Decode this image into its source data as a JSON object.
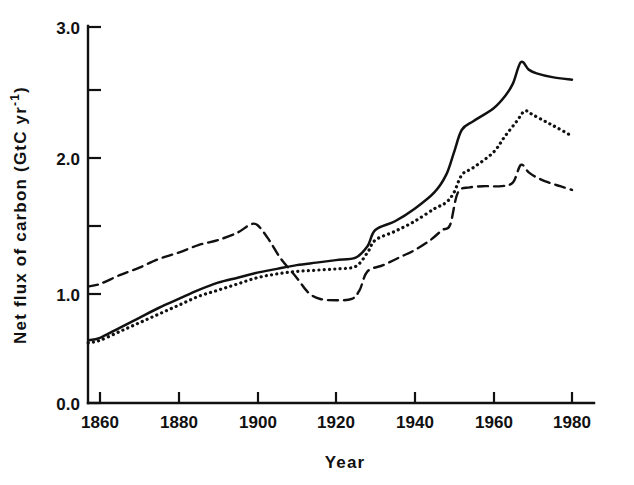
{
  "chart_data": {
    "type": "line",
    "title": "",
    "xlabel": "Year",
    "ylabel": "Net flux of carbon (GtC yr-1)",
    "ylabel_main": "Net flux of carbon (GtC yr",
    "ylabel_sup": "-1",
    "ylabel_tail": ")",
    "xlim": [
      1856,
      1982
    ],
    "ylim": [
      0.0,
      3.0
    ],
    "grid": false,
    "legend": "none",
    "x_ticks": [
      1860,
      1880,
      1900,
      1920,
      1940,
      1960,
      1980
    ],
    "x_tick_labels": [
      "1860",
      "1880",
      "1900",
      "1920",
      "1940",
      "1960",
      "1980"
    ],
    "y_ticks": [
      0.0,
      0.5,
      1.0,
      1.5,
      2.0,
      2.5,
      3.0
    ],
    "y_tick_labels": [
      "0.0",
      "",
      "1.0",
      "",
      "2.0",
      "",
      "3.0"
    ],
    "y_labeled_ticks": [
      0.0,
      1.0,
      2.0,
      3.0
    ],
    "series": [
      {
        "name": "solid",
        "style": "solid",
        "color": "#111111",
        "x": [
          1857,
          1860,
          1865,
          1870,
          1875,
          1880,
          1885,
          1890,
          1895,
          1900,
          1905,
          1910,
          1915,
          1920,
          1925,
          1928,
          1930,
          1935,
          1940,
          1945,
          1948,
          1950,
          1952,
          1955,
          1960,
          1963,
          1965,
          1967,
          1969,
          1971,
          1975,
          1980
        ],
        "y": [
          0.5,
          0.52,
          0.6,
          0.68,
          0.76,
          0.83,
          0.9,
          0.96,
          1.0,
          1.04,
          1.07,
          1.1,
          1.12,
          1.14,
          1.16,
          1.25,
          1.38,
          1.45,
          1.55,
          1.68,
          1.82,
          2.0,
          2.18,
          2.25,
          2.35,
          2.45,
          2.55,
          2.72,
          2.66,
          2.63,
          2.6,
          2.58
        ]
      },
      {
        "name": "dotted",
        "style": "dotted",
        "color": "#111111",
        "x": [
          1857,
          1860,
          1865,
          1870,
          1875,
          1880,
          1885,
          1890,
          1895,
          1900,
          1905,
          1910,
          1915,
          1920,
          1925,
          1928,
          1930,
          1935,
          1940,
          1945,
          1948,
          1950,
          1952,
          1955,
          1960,
          1963,
          1966,
          1968,
          1970,
          1973,
          1976,
          1980
        ],
        "y": [
          0.48,
          0.5,
          0.57,
          0.64,
          0.71,
          0.78,
          0.85,
          0.9,
          0.95,
          1.0,
          1.03,
          1.05,
          1.06,
          1.07,
          1.09,
          1.2,
          1.3,
          1.37,
          1.45,
          1.55,
          1.6,
          1.68,
          1.82,
          1.88,
          2.0,
          2.13,
          2.25,
          2.33,
          2.3,
          2.25,
          2.2,
          2.13
        ]
      },
      {
        "name": "dashed",
        "style": "dashed",
        "color": "#111111",
        "x": [
          1857,
          1860,
          1865,
          1870,
          1875,
          1880,
          1885,
          1890,
          1895,
          1898,
          1900,
          1903,
          1906,
          1910,
          1913,
          1916,
          1920,
          1924,
          1926,
          1928,
          1932,
          1936,
          1940,
          1944,
          1947,
          1949,
          1951,
          1954,
          1958,
          1962,
          1965,
          1967,
          1969,
          1971,
          1974,
          1977,
          1980
        ],
        "y": [
          0.93,
          0.95,
          1.02,
          1.08,
          1.15,
          1.2,
          1.26,
          1.3,
          1.36,
          1.42,
          1.42,
          1.3,
          1.15,
          1.0,
          0.88,
          0.83,
          0.82,
          0.83,
          0.9,
          1.05,
          1.1,
          1.16,
          1.22,
          1.3,
          1.38,
          1.42,
          1.68,
          1.72,
          1.73,
          1.73,
          1.76,
          1.9,
          1.84,
          1.8,
          1.76,
          1.73,
          1.7
        ]
      }
    ],
    "notes": {
      "peak_solid": 2.72,
      "peak_solid_year": 1967,
      "peak_dotted": 2.33,
      "peak_dotted_year": 1968,
      "peak_dashed": 1.9,
      "peak_dashed_year": 1967,
      "end_solid": 2.58,
      "end_dotted": 2.13,
      "end_dashed": 1.7
    }
  }
}
